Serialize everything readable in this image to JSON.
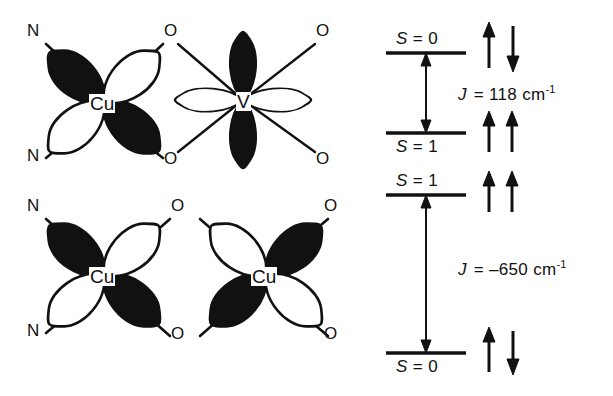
{
  "figure": {
    "background_color": "#ffffff",
    "stroke_color": "#111111",
    "lobe_fill_dark": "#111111",
    "lobe_fill_light": "#ffffff"
  },
  "panels": {
    "top_left": {
      "name": "Cu-V heterodinuclear magnetic orbital scheme",
      "centers": [
        {
          "symbol": "Cu",
          "x": 104,
          "y": 102,
          "orbital": "d(x2-y2)",
          "orientation": "diagonal"
        },
        {
          "symbol": "V",
          "x": 243,
          "y": 100,
          "orbital": "d(xy)",
          "orientation": "axial"
        }
      ],
      "donor_labels": [
        {
          "text": "N",
          "x": 29,
          "y": 30
        },
        {
          "text": "N",
          "x": 29,
          "y": 155
        },
        {
          "text": "O",
          "x": 169,
          "y": 30
        },
        {
          "text": "O",
          "x": 169,
          "y": 158
        },
        {
          "text": "O",
          "x": 320,
          "y": 30
        },
        {
          "text": "O",
          "x": 320,
          "y": 158
        }
      ]
    },
    "bottom_left": {
      "name": "Cu-Cu homodinuclear magnetic orbital scheme",
      "centers": [
        {
          "symbol": "Cu",
          "x": 104,
          "y": 275,
          "orbital": "d(x2-y2)",
          "orientation": "diagonal"
        },
        {
          "symbol": "Cu",
          "x": 266,
          "y": 275,
          "orbital": "d(x2-y2)",
          "orientation": "diagonal"
        }
      ],
      "donor_labels": [
        {
          "text": "N",
          "x": 29,
          "y": 205
        },
        {
          "text": "N",
          "x": 29,
          "y": 330
        },
        {
          "text": "O",
          "x": 176,
          "y": 205
        },
        {
          "text": "O",
          "x": 176,
          "y": 333
        },
        {
          "text": "O",
          "x": 321,
          "y": 205
        },
        {
          "text": "O",
          "x": 321,
          "y": 333
        }
      ]
    }
  },
  "energy_diagram": {
    "name": "spin-state energy level diagram",
    "schemes": [
      {
        "id": "ferromagnetic",
        "upper_level": {
          "label_sym": "S",
          "label_eq": " = 0",
          "full": "S = 0"
        },
        "lower_level": {
          "label_sym": "S",
          "label_eq": " = 1",
          "full": "S = 1"
        },
        "coupling": {
          "sym": "J",
          "eq": "=",
          "value": "118",
          "unit": "cm",
          "exponent": "-1",
          "full": "J  = 118 cm-1"
        },
        "upper_spins": [
          "up",
          "down"
        ],
        "lower_spins": [
          "up",
          "up"
        ]
      },
      {
        "id": "antiferromagnetic",
        "upper_level": {
          "label_sym": "S",
          "label_eq": " = 1",
          "full": "S = 1"
        },
        "lower_level": {
          "label_sym": "S",
          "label_eq": " = 0",
          "full": "S = 0"
        },
        "coupling": {
          "sym": "J",
          "eq": "=",
          "value": "–650",
          "unit": "cm",
          "exponent": "-1",
          "full": "J  = –650 cm-1"
        },
        "upper_spins": [
          "up",
          "up"
        ],
        "lower_spins": [
          "up",
          "down"
        ]
      }
    ]
  }
}
